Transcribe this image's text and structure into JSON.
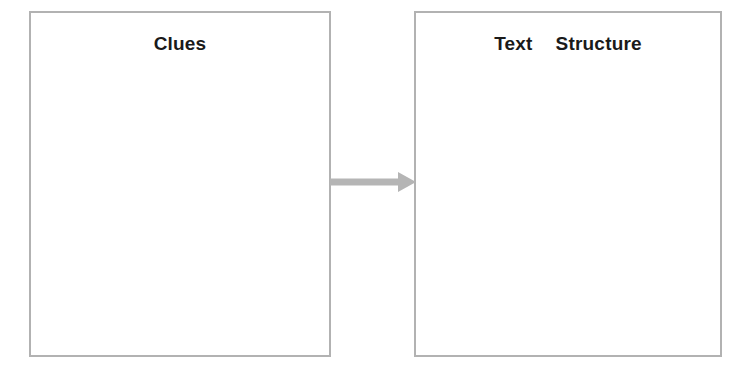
{
  "canvas": {
    "width": 748,
    "height": 374,
    "background_color": "#ffffff"
  },
  "diagram": {
    "type": "graphic-organizer",
    "orientation": "left-to-right",
    "border_color": "#b2b2b2",
    "text_color": "#1a1a1a",
    "arrow_color": "#b5b5b5",
    "boxes": [
      {
        "id": "clues",
        "title": "Clues",
        "content": "",
        "fill_color": "#ffffff"
      },
      {
        "id": "text-structure",
        "title": "Text  Structure",
        "content": "",
        "fill_color": "#ffffff"
      }
    ],
    "connector": {
      "icon": "arrow-right-icon",
      "from": "clues",
      "to": "text-structure",
      "color": "#b5b5b5"
    }
  }
}
